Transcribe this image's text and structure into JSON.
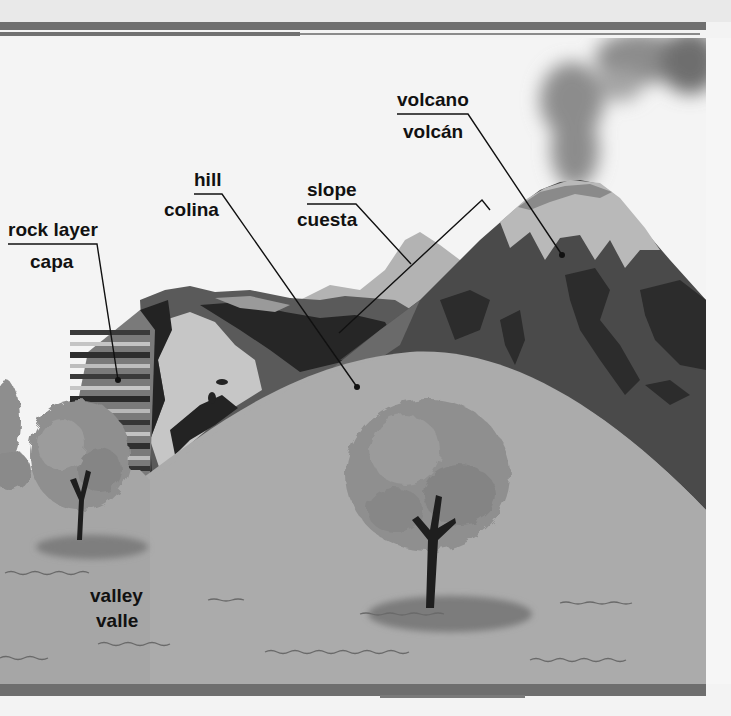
{
  "diagram": {
    "languages": [
      "English",
      "Spanish"
    ],
    "labels": [
      {
        "id": "volcano",
        "en": "volcano",
        "es": "volcán"
      },
      {
        "id": "hill",
        "en": "hill",
        "es": "colina"
      },
      {
        "id": "slope",
        "en": "slope",
        "es": "cuesta"
      },
      {
        "id": "rock-layer",
        "en": "rock layer",
        "es": "capa"
      },
      {
        "id": "valley",
        "en": "valley",
        "es": "valle"
      }
    ]
  },
  "colors": {
    "sky": "#f2f2f2",
    "ground": "#a6a6a6",
    "hill": "#ababab",
    "volcano_dark": "#4a4a4a",
    "volcano_darker": "#2c2c2c",
    "volcano_snow": "#b9b9b9",
    "smoke": "#8e8e8e",
    "far_peak": "#b3b3b3",
    "cliff_dark": "#232323",
    "cliff_light": "#c6c6c6",
    "tree_foliage": "#8f8f8f",
    "trunk": "#1e1e1e",
    "border_band": "#707070",
    "label_text": "#111111",
    "leader_line": "#111111"
  }
}
